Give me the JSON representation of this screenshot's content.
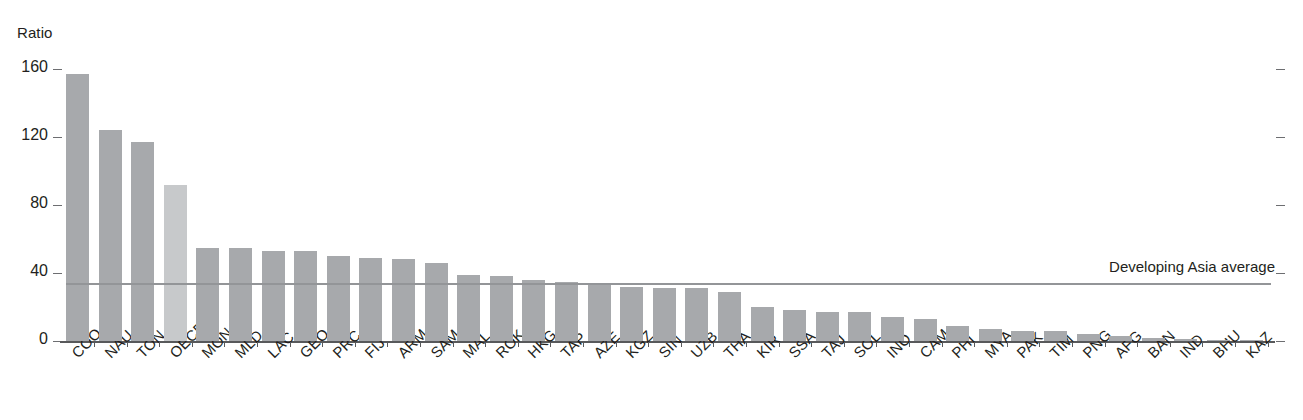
{
  "chart_data": {
    "type": "bar",
    "title": "",
    "subtitle": "",
    "xlabel": "",
    "ylabel": "Ratio",
    "ylim": [
      0,
      160
    ],
    "yticks": [
      0,
      40,
      80,
      120,
      160
    ],
    "grid": false,
    "legend": null,
    "categories": [
      "COO",
      "NAU",
      "TON",
      "OECD",
      "MON",
      "MLD",
      "LAC",
      "GEO",
      "PRC",
      "FIJ",
      "ARM",
      "SAM",
      "MAL",
      "ROK",
      "HKG",
      "TAP",
      "AZE",
      "KGZ",
      "SIN",
      "UZB",
      "THA",
      "KIR",
      "SSA",
      "TAJ",
      "SOL",
      "INO",
      "CAM",
      "PHI",
      "MYA",
      "PAK",
      "TIM",
      "PNG",
      "AFG",
      "BAN",
      "IND",
      "BHU",
      "KAZ"
    ],
    "values": [
      157,
      124,
      117,
      92,
      55,
      55,
      53,
      53,
      50,
      49,
      48,
      46,
      39,
      38,
      36,
      35,
      34,
      32,
      31,
      31,
      29,
      20,
      18,
      17,
      17,
      14,
      13,
      9,
      7,
      6,
      6,
      4,
      3,
      2,
      1,
      0.5,
      0.4
    ],
    "highlight_categories": [
      "OECD"
    ],
    "bar_color": "#a7a9ac",
    "highlight_bar_color": "#c7c9cb",
    "annotations": [
      {
        "name": "developing-asia-average",
        "label": "Developing Asia average",
        "value": 34,
        "line_color": "#939598"
      }
    ]
  }
}
